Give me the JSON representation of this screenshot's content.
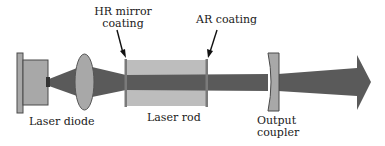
{
  "diagram": {
    "components": [
      {
        "id": "laser-diode",
        "label": "Laser diode"
      },
      {
        "id": "focusing-lens",
        "label": ""
      },
      {
        "id": "laser-rod",
        "label": "Laser rod"
      },
      {
        "id": "output-coupler",
        "label": "Output\ncoupler"
      }
    ],
    "annotations": {
      "hr_line1": "HR mirror",
      "hr_line2": "coating",
      "ar": "AR coating"
    },
    "labels": {
      "laser_diode": "Laser diode",
      "laser_rod": "Laser rod",
      "output_coupler_line1": "Output",
      "output_coupler_line2": "coupler"
    },
    "colors": {
      "component_fill": "#a8a8a8",
      "component_stroke": "#4a4a4a",
      "beam": "#5a5a5a",
      "rod_fill": "#bdbdbd",
      "coating": "#7a7a7a",
      "text": "#1a1a1a"
    }
  }
}
